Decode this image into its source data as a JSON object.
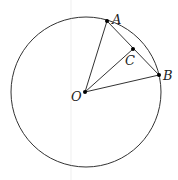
{
  "diagram": {
    "type": "circle-geometry",
    "circle": {
      "center": "O",
      "cx": 86,
      "cy": 92,
      "r": 75
    },
    "points": [
      {
        "name": "A",
        "x": 107,
        "y": 21,
        "label": "A",
        "lx": 112,
        "ly": 24
      },
      {
        "name": "B",
        "x": 159,
        "y": 75,
        "label": "B",
        "lx": 163,
        "ly": 80
      },
      {
        "name": "C",
        "x": 133,
        "y": 49,
        "label": "C",
        "lx": 125,
        "ly": 65
      },
      {
        "name": "O",
        "x": 85,
        "y": 92,
        "label": "O",
        "lx": 71,
        "ly": 101
      }
    ],
    "segments": [
      [
        "O",
        "A"
      ],
      [
        "O",
        "B"
      ],
      [
        "O",
        "C"
      ],
      [
        "A",
        "B"
      ]
    ],
    "colors": {
      "stroke": "#333333",
      "point": "#000000",
      "artifact": "#eeeeee"
    }
  }
}
